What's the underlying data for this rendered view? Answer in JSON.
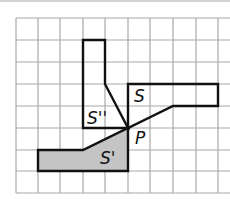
{
  "diagram": {
    "grid": {
      "x_lines": [
        16,
        38,
        60,
        83,
        105,
        128,
        150,
        173,
        196,
        218
      ],
      "y_lines": [
        18,
        40,
        62,
        84,
        106,
        128,
        150,
        171,
        193
      ],
      "top_rule_y": 1,
      "color": "#a8a8a8"
    },
    "shapes": [
      {
        "name": "S",
        "points": "128,84 218,84 218,106 173,106 128,128",
        "shaded": false
      },
      {
        "name": "S''",
        "points": "83,40 105,40 105,84 128,128 83,128",
        "shaded": false
      },
      {
        "name": "S'",
        "points": "128,128 128,171 38,171 38,150 83,150",
        "shaded": true,
        "fill": "#c4c4c4"
      }
    ],
    "labels": [
      {
        "id": "S",
        "text": "S",
        "x": 134,
        "y": 102
      },
      {
        "id": "S2",
        "text": "S''",
        "x": 87,
        "y": 124
      },
      {
        "id": "S1",
        "text": "S'",
        "x": 100,
        "y": 164
      },
      {
        "id": "P",
        "text": "P",
        "x": 135,
        "y": 144
      }
    ],
    "point_P": {
      "x": 128,
      "y": 128
    }
  }
}
